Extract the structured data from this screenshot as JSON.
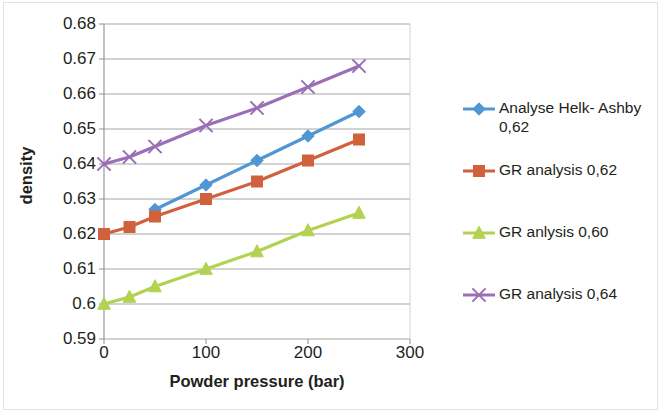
{
  "chart_data": {
    "type": "line",
    "title": "",
    "xlabel": "Powder pressure (bar)",
    "ylabel": "density",
    "xlim": [
      0,
      300
    ],
    "ylim": [
      0.59,
      0.68
    ],
    "x_ticks": [
      "0",
      "100",
      "200",
      "300"
    ],
    "x_tick_values": [
      0,
      100,
      200,
      300
    ],
    "y_ticks": [
      "0.59",
      "0.6",
      "0.61",
      "0.62",
      "0.63",
      "0.64",
      "0.65",
      "0.66",
      "0.67",
      "0.68"
    ],
    "y_tick_values": [
      0.59,
      0.6,
      0.61,
      0.62,
      0.63,
      0.64,
      0.65,
      0.66,
      0.67,
      0.68
    ],
    "grid": "horizontal",
    "legend_position": "right",
    "series": [
      {
        "name": "Analyse Helk- Ashby 0,62",
        "color": "#4F96D2",
        "marker": "diamond",
        "x": [
          50,
          100,
          150,
          200,
          250
        ],
        "values": [
          0.627,
          0.634,
          0.641,
          0.648,
          0.655
        ]
      },
      {
        "name": "GR analysis 0,62",
        "color": "#D1603D",
        "marker": "square",
        "x": [
          0,
          25,
          50,
          100,
          150,
          200,
          250
        ],
        "values": [
          0.62,
          0.622,
          0.625,
          0.63,
          0.635,
          0.641,
          0.647
        ]
      },
      {
        "name": "GR anlysis 0,60",
        "color": "#B2D250",
        "marker": "triangle",
        "x": [
          0,
          25,
          50,
          100,
          150,
          200,
          250
        ],
        "values": [
          0.6,
          0.602,
          0.605,
          0.61,
          0.615,
          0.621,
          0.626
        ]
      },
      {
        "name": "GR analysis 0,64",
        "color": "#9A6FB5",
        "marker": "x",
        "x": [
          0,
          25,
          50,
          100,
          150,
          200,
          250
        ],
        "values": [
          0.64,
          0.642,
          0.645,
          0.651,
          0.656,
          0.662,
          0.668
        ]
      }
    ]
  },
  "legend": {
    "items": [
      {
        "label": "Analyse Helk- Ashby\n0,62",
        "color": "#4F96D2",
        "marker": "diamond"
      },
      {
        "label": "GR analysis 0,62",
        "color": "#D1603D",
        "marker": "square"
      },
      {
        "label": "GR anlysis 0,60",
        "color": "#B2D250",
        "marker": "triangle"
      },
      {
        "label": "GR analysis 0,64",
        "color": "#9A6FB5",
        "marker": "x"
      }
    ]
  }
}
